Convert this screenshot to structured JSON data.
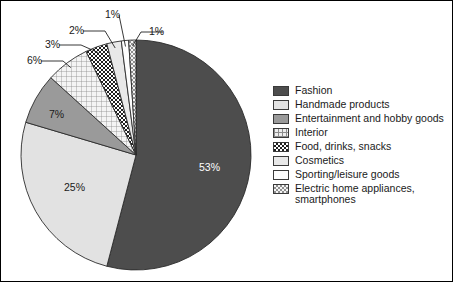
{
  "chart_data": {
    "type": "pie",
    "title": "",
    "subtitle": "",
    "xlabel": "",
    "ylabel": "",
    "legend_position": "right",
    "grid": false,
    "value_suffix": "%",
    "categories": [
      "Fashion",
      "Handmade products",
      "Entertainment and hobby goods",
      "Interior",
      "Food, drinks, snacks",
      "Cosmetics",
      "Sporting/leisure goods",
      "Electric home appliances, smartphones"
    ],
    "values": [
      53,
      25,
      7,
      6,
      3,
      2,
      1,
      1
    ],
    "slices": [
      {
        "label": "Fashion",
        "value": 53,
        "display": "53%",
        "fill": "#4d4d4d",
        "pattern": "solid",
        "label_placement": "inside",
        "label_color": "#ffffff",
        "label_x": 198,
        "label_y": 170
      },
      {
        "label": "Handmade products",
        "value": 25,
        "display": "25%",
        "fill": "#e2e2e2",
        "pattern": "solid",
        "label_placement": "inside",
        "label_color": "#1a1a1a",
        "label_x": 63,
        "label_y": 190
      },
      {
        "label": "Entertainment and hobby goods",
        "value": 7,
        "display": "7%",
        "fill": "#9a9a9a",
        "pattern": "solid",
        "label_placement": "inside",
        "label_color": "#1a1a1a",
        "label_x": 48,
        "label_y": 117
      },
      {
        "label": "Interior",
        "value": 6,
        "display": "6%",
        "fill": "#eeeeee",
        "pattern": "grid",
        "label_placement": "callout",
        "label_color": "#1a1a1a",
        "label_x": 26,
        "label_y": 63
      },
      {
        "label": "Food, drinks, snacks",
        "value": 3,
        "display": "3%",
        "fill": "#ffffff",
        "pattern": "checker-dark",
        "label_placement": "callout",
        "label_color": "#1a1a1a",
        "label_x": 44,
        "label_y": 47
      },
      {
        "label": "Cosmetics",
        "value": 2,
        "display": "2%",
        "fill": "#e8e8e8",
        "pattern": "solid",
        "label_placement": "callout",
        "label_color": "#1a1a1a",
        "label_x": 68,
        "label_y": 33
      },
      {
        "label": "Sporting/leisure goods",
        "value": 1,
        "display": "1%",
        "fill": "#fdfdfd",
        "pattern": "solid",
        "label_placement": "callout",
        "label_color": "#1a1a1a",
        "label_x": 104,
        "label_y": 17
      },
      {
        "label": "Electric home appliances, smartphones",
        "value": 1,
        "display": "1%",
        "fill": "#f2f2f2",
        "pattern": "checker-light",
        "label_placement": "callout",
        "label_color": "#1a1a1a",
        "label_x": 148,
        "label_y": 34
      }
    ],
    "geometry": {
      "center_x": 135,
      "center_y": 154,
      "radius": 115,
      "start_angle_deg": 0,
      "direction": "clockwise"
    }
  },
  "legend": {
    "items": [
      {
        "label": "Fashion",
        "swatch": "solid-dark",
        "color": "#4d4d4d"
      },
      {
        "label": "Handmade products",
        "swatch": "solid-light",
        "color": "#e2e2e2"
      },
      {
        "label": "Entertainment and hobby goods",
        "swatch": "solid-medium",
        "color": "#9a9a9a"
      },
      {
        "label": "Interior",
        "swatch": "grid",
        "color": "#eeeeee"
      },
      {
        "label": "Food, drinks, snacks",
        "swatch": "checker-dark",
        "color": "#ffffff"
      },
      {
        "label": "Cosmetics",
        "swatch": "solid-lighter",
        "color": "#e8e8e8"
      },
      {
        "label": "Sporting/leisure goods",
        "swatch": "solid-white",
        "color": "#fdfdfd"
      },
      {
        "label": "Electric home appliances,\nsmartphones",
        "swatch": "checker-light",
        "color": "#f2f2f2"
      }
    ]
  }
}
